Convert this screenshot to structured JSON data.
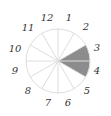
{
  "diagram": {
    "type": "clock-sector-diagram",
    "segment_count": 12,
    "labels": [
      "1",
      "2",
      "3",
      "4",
      "5",
      "6",
      "7",
      "8",
      "9",
      "10",
      "11",
      "12"
    ],
    "shaded_segments": [
      "3",
      "4"
    ],
    "colors": {
      "shaded": "#8c8c8c",
      "spokes": "#dddddd",
      "outline": "#dddddd",
      "label": "#333333"
    }
  }
}
